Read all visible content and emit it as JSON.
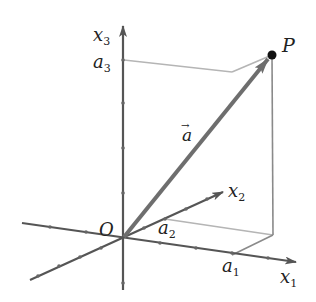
{
  "diagram": {
    "colors": {
      "axis": "#555555",
      "vector": "#6e6e6e",
      "guide": "#b5b5b5",
      "point": "#111111",
      "text": "#222222"
    },
    "origin": {
      "label": "O"
    },
    "axes": [
      {
        "id": "x1",
        "label": "x",
        "subscript": "1",
        "component_label": "a",
        "component_subscript": "1"
      },
      {
        "id": "x2",
        "label": "x",
        "subscript": "2",
        "component_label": "a",
        "component_subscript": "2"
      },
      {
        "id": "x3",
        "label": "x",
        "subscript": "3",
        "component_label": "a",
        "component_subscript": "3"
      }
    ],
    "point": {
      "label": "P"
    },
    "vector": {
      "label": "a",
      "arrow_accent": "→"
    }
  }
}
